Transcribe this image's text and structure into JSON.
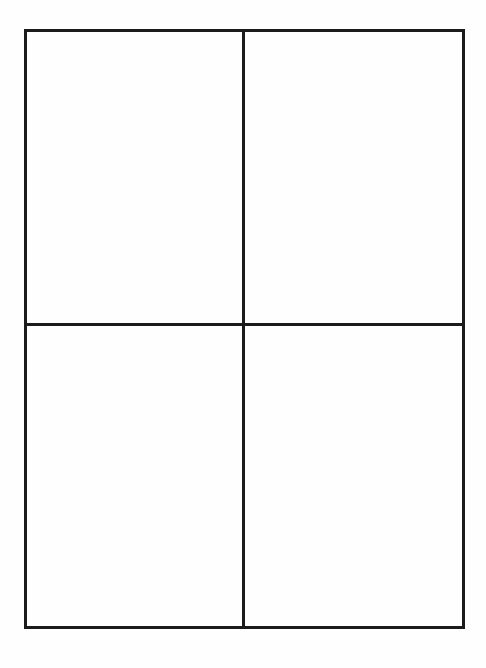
{
  "document": {
    "kind": "blank-four-quadrant-worksheet",
    "page_background": "#fefefe",
    "ink_color": "#1b1b1b"
  },
  "grid": {
    "rows": 2,
    "columns": 2,
    "border_color": "#1b1b1b",
    "border_width_px": 3,
    "cells": [
      {
        "position": "top-left",
        "row": 1,
        "column": 1,
        "text": ""
      },
      {
        "position": "top-right",
        "row": 1,
        "column": 2,
        "text": ""
      },
      {
        "position": "bottom-left",
        "row": 2,
        "column": 1,
        "text": ""
      },
      {
        "position": "bottom-right",
        "row": 2,
        "column": 2,
        "text": ""
      }
    ]
  }
}
